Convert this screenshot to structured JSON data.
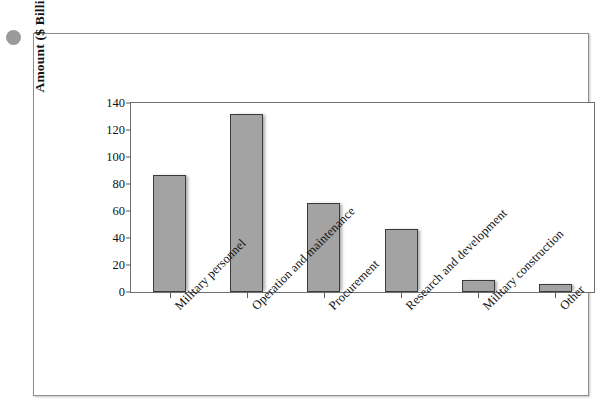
{
  "figure": {
    "y_axis_title": "Amount ($ Billions)"
  },
  "chart_data": {
    "type": "bar",
    "title": "",
    "xlabel": "",
    "ylabel": "Amount ($ Billions)",
    "ylim": [
      0,
      140
    ],
    "yticks": [
      0,
      20,
      40,
      60,
      80,
      100,
      120,
      140
    ],
    "ytick_labels": [
      "0",
      "20",
      "40",
      "60",
      "80",
      "100",
      "120",
      "140"
    ],
    "grid": false,
    "legend": false,
    "bar_color": "#a3a3a3",
    "bar_edge_color": "#3a3a3a",
    "categories": [
      "Military personnel",
      "Operation and maintenance",
      "Procurement",
      "Research and development",
      "Military construction",
      "Other"
    ],
    "values": [
      87,
      132,
      66,
      47,
      9,
      6
    ]
  }
}
